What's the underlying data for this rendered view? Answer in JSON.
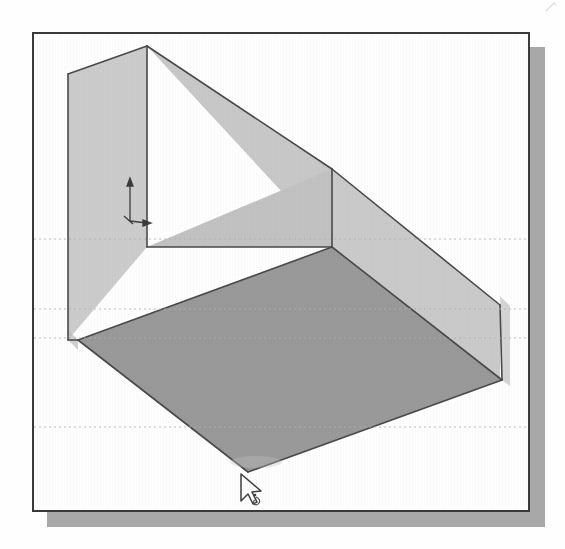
{
  "document": {
    "kind": "scanned-illustration",
    "subject": "3d-cad-wedge-solid-isometric",
    "caption": "",
    "width": 565,
    "height": 549
  },
  "colors": {
    "page_background": "#ffffff",
    "frame_background": "#ffffff",
    "frame_border": "#3a3a3a",
    "window_shadow": "#a8a8a8",
    "face_light": "#cfcfcf",
    "face_light_upper": "#c9c9c9",
    "face_light_front": "#c6c6c6",
    "face_floor_dark": "#9a9a9a",
    "edge_line": "#4a4a4a",
    "scan_dotted_line": "#b4b4b4",
    "cursor_outline": "#404040",
    "axis_marker": "#3c3c3c"
  },
  "window": {
    "frame_x": 32,
    "frame_y": 32,
    "frame_width": 498,
    "frame_height": 480,
    "border_width": 2,
    "shadow_offset_x": 15,
    "shadow_offset_y": 15
  },
  "model": {
    "name": "wedge-solid",
    "view": "isometric",
    "faces": [
      {
        "name": "left-vertical-wall",
        "fill": "#cdcdcd",
        "points": "34,40 113,12 113,213 34,306"
      },
      {
        "name": "top-sloped-ramp-face",
        "fill": "#cacaca",
        "points": "113,12 298,135 466,271 299,213"
      },
      {
        "name": "inner-vertical-back-wall",
        "fill": "#c4c4c4",
        "points": "113,213 298,135 298,213 113,213"
      },
      {
        "name": "right-vertical-wall",
        "fill": "#cbcbcb",
        "points": "298,135 466,271 466,346 298,213"
      },
      {
        "name": "floor-plane-dark",
        "fill": "#9a9a9a",
        "points": "44,306 298,213 468,346 214,438"
      }
    ],
    "edges": [
      {
        "name": "top-ridge-left",
        "x1": 34,
        "y1": 40,
        "x2": 113,
        "y2": 12
      },
      {
        "name": "top-ridge-slope",
        "x1": 113,
        "y1": 12,
        "x2": 298,
        "y2": 135
      },
      {
        "name": "ramp-lower-edge",
        "x1": 298,
        "y1": 135,
        "x2": 466,
        "y2": 271
      },
      {
        "name": "left-wall-front-vertical",
        "x1": 113,
        "y1": 12,
        "x2": 113,
        "y2": 213
      },
      {
        "name": "left-wall-outer-vertical",
        "x1": 34,
        "y1": 40,
        "x2": 34,
        "y2": 306
      },
      {
        "name": "inner-corner-vertical",
        "x1": 298,
        "y1": 135,
        "x2": 298,
        "y2": 213
      },
      {
        "name": "right-outer-vertical",
        "x1": 466,
        "y1": 271,
        "x2": 468,
        "y2": 346
      },
      {
        "name": "floor-back-left",
        "x1": 113,
        "y1": 213,
        "x2": 298,
        "y2": 213
      },
      {
        "name": "floor-left-front",
        "x1": 44,
        "y1": 306,
        "x2": 214,
        "y2": 438
      },
      {
        "name": "floor-right-front",
        "x1": 214,
        "y1": 438,
        "x2": 468,
        "y2": 346
      },
      {
        "name": "floor-back-diagonal",
        "x1": 44,
        "y1": 306,
        "x2": 298,
        "y2": 213
      },
      {
        "name": "floor-right-diagonal",
        "x1": 298,
        "y1": 213,
        "x2": 468,
        "y2": 346
      }
    ]
  },
  "scan_lines": [
    {
      "name": "scan-dotted-line-1",
      "y": 205,
      "opacity": 0.55
    },
    {
      "name": "scan-dotted-line-2",
      "y": 275,
      "opacity": 0.55
    },
    {
      "name": "scan-dotted-line-3",
      "y": 304,
      "opacity": 0.55
    },
    {
      "name": "scan-dotted-line-4",
      "y": 393,
      "opacity": 0.55
    }
  ],
  "axis_marker": {
    "name": "origin-axis-indicator",
    "x": 95,
    "y": 142,
    "vertical_arrow_length": 40,
    "horizontal_arrow_length": 18,
    "label": ""
  },
  "cursor": {
    "name": "mouse-pointer",
    "x": 207,
    "y": 445,
    "style": "arrow-with-small-glyph",
    "label": ""
  }
}
